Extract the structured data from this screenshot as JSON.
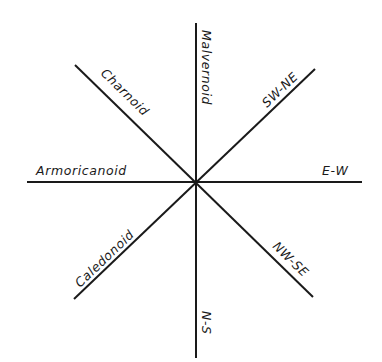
{
  "diagram": {
    "type": "orientation-rose",
    "center": [
      195,
      182
    ],
    "line_color": "#1a1a1a",
    "background": "#ffffff",
    "labels": {
      "malvernoid": "Malvernoid",
      "sw_ne": "SW-NE",
      "charnoid": "Charnoid",
      "armoricanoid": "Armoricanoid",
      "e_w": "E-W",
      "caledonoid": "Caledonoid",
      "nw_se": "NW-SE",
      "n_s": "N-S"
    },
    "lines": [
      {
        "name": "Malvernoid / N-S",
        "direction": "vertical"
      },
      {
        "name": "Armoricanoid / E-W",
        "direction": "horizontal"
      },
      {
        "name": "Charnoid / NW-SE",
        "direction": "diagonal NW-SE"
      },
      {
        "name": "Caledonoid / SW-NE",
        "direction": "diagonal SW-NE"
      }
    ]
  }
}
